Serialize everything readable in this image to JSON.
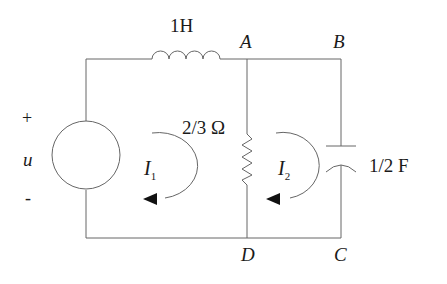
{
  "diagram": {
    "type": "circuit",
    "source": {
      "plus": "+",
      "name": "u",
      "minus": "-"
    },
    "inductor": {
      "label": "1H"
    },
    "resistor": {
      "label": "2/3 Ω"
    },
    "capacitor": {
      "label": "1/2 F"
    },
    "nodes": {
      "A": "A",
      "B": "B",
      "C": "C",
      "D": "D"
    },
    "loops": {
      "I1": {
        "main": "I",
        "sub": "1"
      },
      "I2": {
        "main": "I",
        "sub": "2"
      }
    }
  }
}
